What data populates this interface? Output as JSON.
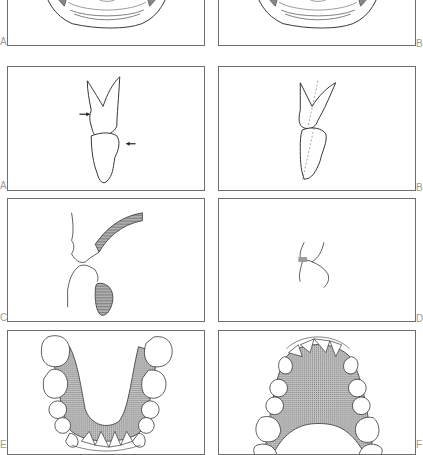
{
  "figure": {
    "type": "dental illustration plate",
    "rows": [
      {
        "row": 1,
        "panels": [
          {
            "label": "A",
            "subject": "cross-section of jaw/oral cavity (cropped at top)"
          },
          {
            "label": "B",
            "subject": "cross-section of jaw/oral cavity (cropped at top)"
          }
        ]
      },
      {
        "row": 2,
        "panels": [
          {
            "label": "A",
            "subject": "upper and lower incisor in occlusion with contact arrows"
          },
          {
            "label": "B",
            "subject": "upper and lower incisor with dashed long axes"
          }
        ]
      },
      {
        "row": 3,
        "panels": [
          {
            "label": "C",
            "subject": "lip profile with hatched tongue/lip tissue"
          },
          {
            "label": "D",
            "subject": "small occlusal contact detail with shaded area"
          }
        ]
      },
      {
        "row": 4,
        "panels": [
          {
            "label": "E",
            "subject": "mandibular dental arch, occlusal view, shaded tongue space"
          },
          {
            "label": "F",
            "subject": "maxillary dental arch, occlusal view, shaded palate"
          }
        ]
      }
    ]
  },
  "colors": {
    "line": "#333333",
    "frame": "#6e6e6e",
    "label": "#9a9a9a",
    "shade": "#9c9c9c"
  }
}
